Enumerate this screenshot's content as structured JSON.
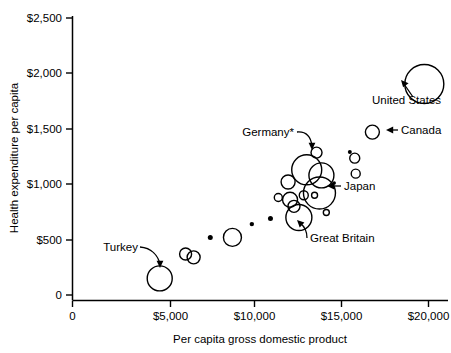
{
  "chart_data": {
    "type": "scatter",
    "title": "",
    "xlabel": "Per capita gross domestic product",
    "ylabel": "Health expenditure per capita",
    "xlim": [
      0,
      21500
    ],
    "ylim": [
      0,
      2600
    ],
    "grid": false,
    "legend_position": "none",
    "xticks": [
      0,
      5000,
      10000,
      15000,
      20000
    ],
    "xtick_labels": [
      "0",
      "$5,000",
      "$10,000",
      "$15,000",
      "$20,000"
    ],
    "yticks": [
      0,
      500,
      1000,
      1500,
      2000,
      2500
    ],
    "ytick_labels": [
      "0",
      "$500",
      "$1,000",
      "$1,500",
      "$2,000",
      "$2,500"
    ],
    "marker": "open-circle",
    "size_encoding": "bubble area proportional to population",
    "points": [
      {
        "id": "p1",
        "label": "Turkey",
        "x": 4450,
        "y": 150,
        "r": 12.5
      },
      {
        "id": "p2",
        "label": "",
        "x": 5770,
        "y": 370,
        "r": 6.0
      },
      {
        "id": "p3",
        "label": "",
        "x": 6180,
        "y": 340,
        "r": 6.5
      },
      {
        "id": "p4",
        "label": "",
        "x": 7030,
        "y": 520,
        "r": 2.5
      },
      {
        "id": "p5",
        "label": "",
        "x": 8160,
        "y": 520,
        "r": 9.0
      },
      {
        "id": "p6",
        "label": "",
        "x": 10100,
        "y": 690,
        "r": 2.5
      },
      {
        "id": "p7",
        "label": "",
        "x": 10500,
        "y": 880,
        "r": 4.0
      },
      {
        "id": "p8",
        "label": "",
        "x": 11000,
        "y": 1020,
        "r": 7.0
      },
      {
        "id": "p9",
        "label": "",
        "x": 11100,
        "y": 860,
        "r": 7.5
      },
      {
        "id": "p10",
        "label": "",
        "x": 11300,
        "y": 800,
        "r": 6.0
      },
      {
        "id": "p11",
        "label": "Great Britain",
        "x": 11550,
        "y": 700,
        "r": 13.0
      },
      {
        "id": "p12",
        "label": "",
        "x": 11800,
        "y": 900,
        "r": 4.5
      },
      {
        "id": "p13",
        "label": "Germany",
        "x": 11950,
        "y": 1130,
        "r": 15.0
      },
      {
        "id": "p14",
        "label": "",
        "x": 12450,
        "y": 1285,
        "r": 5.5
      },
      {
        "id": "p15",
        "label": "",
        "x": 12350,
        "y": 900,
        "r": 3.0
      },
      {
        "id": "p16",
        "label": "Japan",
        "x": 12600,
        "y": 920,
        "r": 16.0
      },
      {
        "id": "p17",
        "label": "",
        "x": 12700,
        "y": 1080,
        "r": 12.5
      },
      {
        "id": "p18",
        "label": "",
        "x": 12950,
        "y": 745,
        "r": 3.0
      },
      {
        "id": "p19",
        "label": "",
        "x": 13350,
        "y": 1010,
        "r": 1.8
      },
      {
        "id": "p20",
        "label": "",
        "x": 14150,
        "y": 1290,
        "r": 2.0
      },
      {
        "id": "p21",
        "label": "",
        "x": 14400,
        "y": 1235,
        "r": 5.0
      },
      {
        "id": "p22",
        "label": "",
        "x": 14450,
        "y": 1095,
        "r": 4.5
      },
      {
        "id": "p23",
        "label": "Canada",
        "x": 15300,
        "y": 1470,
        "r": 7.0
      },
      {
        "id": "p24",
        "label": "United States",
        "x": 17950,
        "y": 1905,
        "r": 19.5
      },
      {
        "id": "p25",
        "label": "",
        "x": 9150,
        "y": 640,
        "r": 2.2
      }
    ],
    "annotations": [
      {
        "id": "a1",
        "text": "Turkey",
        "target": "p1"
      },
      {
        "id": "a2",
        "text": "Germany*",
        "target": "p13"
      },
      {
        "id": "a3",
        "text": "Japan",
        "target": "p16"
      },
      {
        "id": "a4",
        "text": "Great Britain",
        "target": "p11"
      },
      {
        "id": "a5",
        "text": "United States",
        "target": "p24"
      },
      {
        "id": "a6",
        "text": "Canada",
        "target": "p23"
      }
    ]
  },
  "axes": {
    "y_title": "Health expenditure per capita",
    "x_title": "Per capita gross domestic product",
    "y_labels": {
      "t0": "0",
      "t500": "$500",
      "t1000": "$1,000",
      "t1500": "$1,500",
      "t2000": "$2,000",
      "t2500": "$2,500"
    },
    "x_labels": {
      "t0": "0",
      "t5000": "$5,000",
      "t10000": "$10,000",
      "t15000": "$15,000",
      "t20000": "$20,000"
    }
  },
  "labels": {
    "turkey": "Turkey",
    "germany": "Germany*",
    "japan": "Japan",
    "great_britain": "Great Britain",
    "united_states": "United States",
    "canada": "Canada"
  },
  "colors": {
    "stroke": "#000000",
    "background": "#ffffff"
  }
}
